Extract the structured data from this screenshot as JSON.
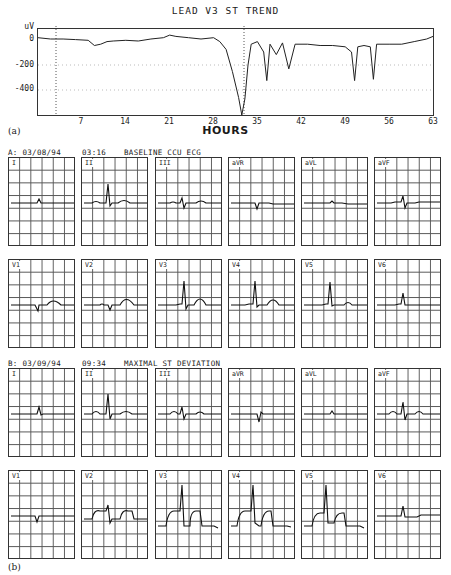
{
  "chart_data": [
    {
      "type": "line",
      "title": "LEAD V3   ST TREND",
      "xlabel": "HOURS",
      "ylabel": "uV",
      "panel_label": "(a)",
      "x_ticks": [
        7,
        14,
        21,
        28,
        35,
        42,
        49,
        56,
        63
      ],
      "y_ticks": [
        0,
        -200,
        -400
      ],
      "xlim": [
        0,
        63
      ],
      "ylim": [
        -600,
        50
      ],
      "grid": "dotted horizontal at -200 and -400",
      "markers": [
        {
          "x": 3,
          "label": "A"
        },
        {
          "x": 33,
          "label": "B"
        }
      ],
      "series": [
        {
          "name": "ST level V3",
          "x": [
            0,
            2,
            4,
            6,
            8,
            9,
            10,
            11,
            12,
            14,
            16,
            18,
            20,
            21,
            22,
            24,
            26,
            28,
            29,
            30,
            31,
            32,
            32.5,
            33,
            33.5,
            34,
            35,
            36,
            36.5,
            37,
            38,
            39,
            40,
            41,
            43,
            45,
            47,
            49,
            50,
            50.5,
            51,
            52,
            53,
            53.5,
            54,
            56,
            58,
            60,
            62,
            63
          ],
          "values": [
            10,
            0,
            0,
            -5,
            -10,
            -50,
            -40,
            -20,
            -15,
            -10,
            -15,
            0,
            10,
            30,
            20,
            10,
            0,
            10,
            -20,
            -80,
            -250,
            -450,
            -590,
            -460,
            -200,
            -40,
            -20,
            -100,
            -320,
            -40,
            -120,
            -30,
            -230,
            -40,
            -40,
            -50,
            -50,
            -60,
            -100,
            -320,
            -60,
            -50,
            -60,
            -310,
            -40,
            -40,
            -40,
            -20,
            0,
            20
          ]
        }
      ]
    }
  ],
  "trend": {
    "title": "LEAD V3   ST TREND",
    "y_unit": "uV",
    "y_ticks": [
      "0",
      "-200",
      "-400"
    ],
    "x_ticks": [
      "7",
      "14",
      "21",
      "28",
      "35",
      "42",
      "49",
      "56",
      "63"
    ],
    "x_label": "HOURS",
    "panel_label": "(a)"
  },
  "ecg": {
    "panel_label": "(b)",
    "sections": [
      {
        "id": "A",
        "header_left": "A: 03/08/94",
        "header_time": "03:16",
        "header_desc": "BASELINE CCU ECG",
        "rows": [
          [
            "I",
            "II",
            "III",
            "aVR",
            "aVL",
            "aVF"
          ],
          [
            "V1",
            "V2",
            "V3",
            "V4",
            "V5",
            "V6"
          ]
        ]
      },
      {
        "id": "B",
        "header_left": "B: 03/09/94",
        "header_time": "09:34",
        "header_desc": "MAXIMAL ST DEVIATION",
        "rows": [
          [
            "I",
            "II",
            "III",
            "aVR",
            "aVL",
            "aVF"
          ],
          [
            "V1",
            "V2",
            "V3",
            "V4",
            "V5",
            "V6"
          ]
        ]
      }
    ]
  }
}
